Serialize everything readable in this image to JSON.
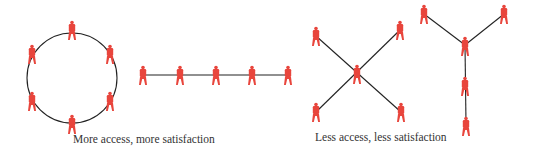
{
  "colors": {
    "person": "#e8453c",
    "line": "#222222",
    "caption": "#333333"
  },
  "networks": [
    {
      "name": "circle",
      "center": [
        72,
        78
      ],
      "radius": 45,
      "people": [
        [
          72,
          30
        ],
        [
          32,
          54
        ],
        [
          110,
          54
        ],
        [
          32,
          101
        ],
        [
          110,
          101
        ],
        [
          72,
          124
        ]
      ]
    },
    {
      "name": "chain",
      "line": [
        [
          143,
          75
        ],
        [
          289,
          75
        ]
      ],
      "people": [
        [
          143,
          74
        ],
        [
          180,
          74
        ],
        [
          216,
          74
        ],
        [
          252,
          74
        ],
        [
          288,
          74
        ]
      ]
    },
    {
      "name": "wheel",
      "hub": [
        357,
        74
      ],
      "people": [
        [
          316,
          36
        ],
        [
          400,
          30
        ],
        [
          316,
          112
        ],
        [
          401,
          112
        ]
      ]
    },
    {
      "name": "y-shape",
      "hub": [
        465,
        45
      ],
      "people": [
        [
          424,
          15
        ],
        [
          504,
          15
        ],
        [
          465,
          87
        ],
        [
          466,
          126
        ]
      ]
    }
  ],
  "captions": {
    "left": "More access, more satisfaction",
    "right": "Less access, less satisfaction"
  }
}
